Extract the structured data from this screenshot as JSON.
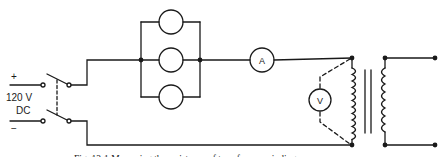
{
  "figure": {
    "caption": "Fig. 13-1 Measuring the resistance of transformer winding",
    "ink_color": "#1a1a1a",
    "background": "#ffffff"
  },
  "source": {
    "polarity_positive": "+",
    "polarity_negative": "−",
    "voltage_label": "120 V",
    "type_label": "DC",
    "switch": "double-pole single-throw switch"
  },
  "components": {
    "lamp_bank": {
      "count": 3,
      "arrangement": "parallel",
      "icon": "lamp-circle"
    },
    "ammeter": {
      "label": "A"
    },
    "voltmeter": {
      "label": "V",
      "connection": "dashed leads across primary winding"
    },
    "transformer": {
      "primary": "winding",
      "core": "iron core (two parallel bars)",
      "secondary": "winding with two output terminals"
    }
  }
}
